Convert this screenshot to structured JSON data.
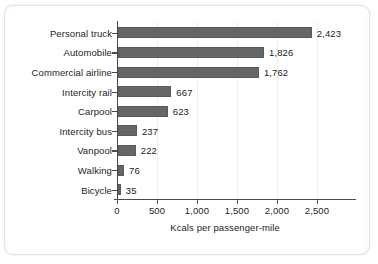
{
  "chart_data": {
    "type": "bar",
    "orientation": "horizontal",
    "title": "",
    "xlabel": "Kcals per passenger-mile",
    "ylabel": "",
    "categories": [
      "Personal truck",
      "Automobile",
      "Commercial airline",
      "Intercity rail",
      "Carpool",
      "Intercity bus",
      "Vanpool",
      "Walking",
      "Bicycle"
    ],
    "values": [
      2423,
      1826,
      1762,
      667,
      623,
      237,
      222,
      76,
      35
    ],
    "value_labels": [
      "2,423",
      "1,826",
      "1,762",
      "667",
      "623",
      "237",
      "222",
      "76",
      "35"
    ],
    "xlim": [
      0,
      2700
    ],
    "xticks": [
      0,
      500,
      1000,
      1500,
      2000,
      2500
    ],
    "xtick_labels": [
      "0",
      "500",
      "1,000",
      "1,500",
      "2,000",
      "2,500"
    ],
    "grid": "vertical",
    "legend": "none",
    "bar_color": "#666666",
    "axis_color": "#4a4a4a",
    "gridline_color": "#ededed",
    "background_color": "#ffffff"
  }
}
